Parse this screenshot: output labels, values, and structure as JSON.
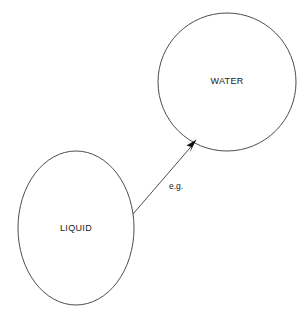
{
  "canvas": {
    "width": 307,
    "height": 322,
    "background_color": "#ffffff"
  },
  "diagram": {
    "type": "concept-relationship-diagram",
    "stroke_color": "#4d4d4d",
    "text_color": "#1a1a1a",
    "nodes": [
      {
        "id": "water",
        "label": "WATER",
        "shape": "circle",
        "cx": 227,
        "cy": 82,
        "rx": 69,
        "ry": 69,
        "fill": "#ffffff",
        "stroke": "#4d4d4d",
        "stroke_width": 1,
        "label_x": 227,
        "label_y": 82
      },
      {
        "id": "liquid",
        "label": "LIQUID",
        "shape": "ellipse",
        "cx": 76,
        "cy": 228,
        "rx": 58,
        "ry": 77,
        "fill": "#ffffff",
        "stroke": "#4d4d4d",
        "stroke_width": 1,
        "label_x": 76,
        "label_y": 229
      }
    ],
    "edges": [
      {
        "id": "liquid-to-water",
        "label": "e.g.",
        "from": "liquid",
        "to": "water",
        "x1": 133,
        "y1": 214,
        "x2": 196,
        "y2": 140,
        "stroke": "#4d4d4d",
        "stroke_width": 1,
        "arrow": "filled-triangle",
        "label_x": 176,
        "label_y": 187
      }
    ]
  }
}
